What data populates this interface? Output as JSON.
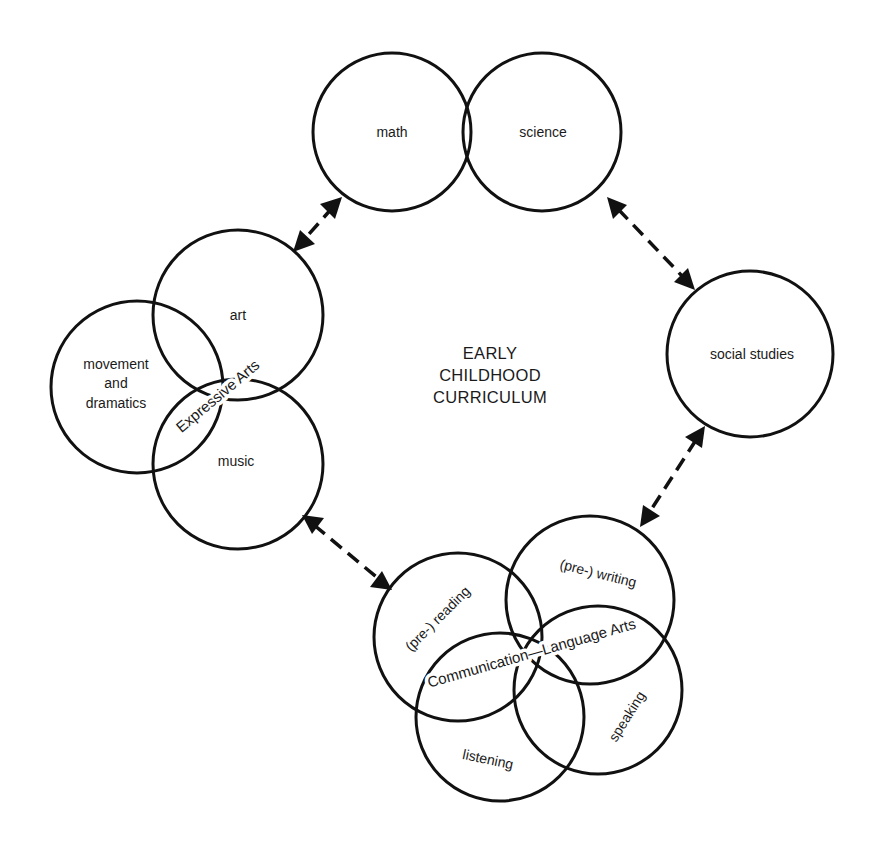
{
  "diagram": {
    "title_lines": [
      "EARLY",
      "CHILDHOOD",
      "CURRICULUM"
    ],
    "colors": {
      "line": "#111111",
      "text": "#1a1a1a",
      "background": "#ffffff"
    },
    "nodes": {
      "math": {
        "label": "math"
      },
      "science": {
        "label": "science"
      },
      "social_studies": {
        "label": "social studies"
      },
      "art": {
        "label": "art"
      },
      "movement": {
        "label_lines": [
          "movement",
          "and",
          "dramatics"
        ]
      },
      "music": {
        "label": "music"
      },
      "reading": {
        "label": "(pre-) reading"
      },
      "writing": {
        "label": "(pre-) writing"
      },
      "listening": {
        "label": "listening"
      },
      "speaking": {
        "label": "speaking"
      }
    },
    "groups": {
      "expressive_arts": {
        "label": "Expressive Arts",
        "members": [
          "art",
          "movement and dramatics",
          "music"
        ]
      },
      "communication": {
        "label": "Communication—Language Arts",
        "members": [
          "(pre-) reading",
          "(pre-) writing",
          "listening",
          "speaking"
        ]
      }
    },
    "connections": [
      {
        "from": "math",
        "to": "art",
        "type": "double-arrow-dashed"
      },
      {
        "from": "science",
        "to": "social studies",
        "type": "double-arrow-dashed"
      },
      {
        "from": "social studies",
        "to": "(pre-) writing",
        "type": "double-arrow-dashed"
      },
      {
        "from": "music",
        "to": "(pre-) reading",
        "type": "double-arrow-dashed"
      }
    ]
  }
}
